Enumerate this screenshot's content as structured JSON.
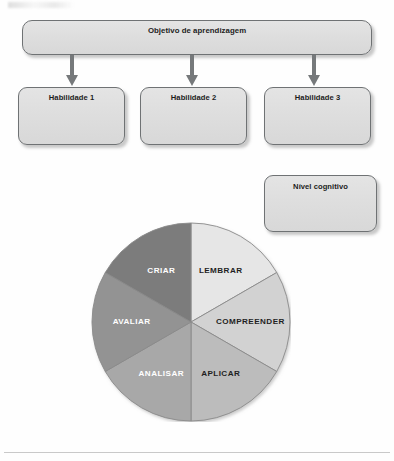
{
  "diagram": {
    "title_box": {
      "label": "Objetivo de aprendizagem"
    },
    "skill_boxes": [
      {
        "label": "Habilidade 1"
      },
      {
        "label": "Habilidade 2"
      },
      {
        "label": "Habilidade 3"
      }
    ],
    "level_box": {
      "label": "Nível cognitivo"
    },
    "arrows": [
      {
        "name": "arrow-to-habilidade-1"
      },
      {
        "name": "arrow-to-habilidade-2"
      },
      {
        "name": "arrow-to-habilidade-3"
      }
    ]
  },
  "chart_data": {
    "type": "pie",
    "title": "",
    "categories": [
      "LEMBRAR",
      "COMPREENDER",
      "APLICAR",
      "ANALISAR",
      "AVALIAR",
      "CRIAR"
    ],
    "values": [
      1,
      1,
      1,
      1,
      1,
      1
    ],
    "value_unit": "equal sixths",
    "slice_angle_deg": 60,
    "start_angle_deg": 0,
    "direction": "clockwise",
    "legend": "none",
    "labels_inside_slices": true,
    "colors": [
      "#e6e6e6",
      "#d2d2d2",
      "#bcbcbc",
      "#a8a8a8",
      "#939393",
      "#7c7c7c"
    ],
    "label_colors": [
      "#1f1f1f",
      "#1f1f1f",
      "#1f1f1f",
      "#ffffff",
      "#ffffff",
      "#ffffff"
    ],
    "outline_color": "#8a8a8a",
    "center": {
      "x": 100,
      "y": 100
    },
    "radius": 99
  },
  "colors": {
    "box_border": "#6f7274",
    "box_fill_top": "#e4e4e4",
    "box_fill_bottom": "#d8d8d8",
    "arrow": "#76797b",
    "page_background": "#fefefe",
    "rule": "#c9c9c9"
  }
}
